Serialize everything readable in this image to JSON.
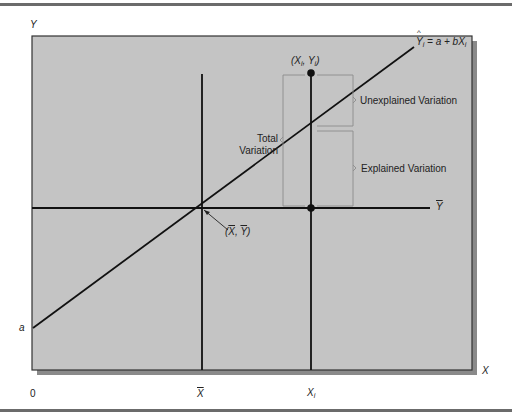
{
  "figure": {
    "axis_labels": {
      "y": "Y",
      "x": "X",
      "origin": "0",
      "intercept": "a"
    },
    "x_ticks": {
      "xbar": "X",
      "xi": "X",
      "xi_sub": "i"
    },
    "point_label": {
      "open": "(X",
      "sub1": "i",
      "mid": ", Y",
      "sub2": "i",
      "close": ")"
    },
    "mean_point_label": {
      "open": "(",
      "x": "X",
      "sep": ", ",
      "y": "Y",
      "close": ")"
    },
    "ybar_label": "Y",
    "equation": {
      "lhs": "Y",
      "lhs_sub": "i",
      "rhs": " = a + bX",
      "rhs_sub": "i"
    },
    "total_variation": [
      "Total",
      "Variation"
    ],
    "unexplained_variation": "Unexplained Variation",
    "explained_variation": "Explained Variation",
    "colors": {
      "panel": "#c4c4c4",
      "shadow": "#8a8a8a",
      "line": "#111111",
      "bracket": "#8c8c8c"
    }
  }
}
